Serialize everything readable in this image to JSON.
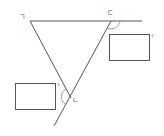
{
  "diagram": {
    "type": "geometry",
    "vertex_labels": [
      {
        "id": "top-left",
        "text": "ㄱ"
      },
      {
        "id": "top-right",
        "text": "ㄷ"
      },
      {
        "id": "bottom",
        "text": "ㄴ"
      }
    ],
    "answer_boxes": [
      {
        "id": "box-right",
        "unit": "°"
      },
      {
        "id": "box-left",
        "unit": "°"
      }
    ],
    "colors": {
      "line": "#555555",
      "box": "#555555",
      "arc": "#777777"
    }
  }
}
